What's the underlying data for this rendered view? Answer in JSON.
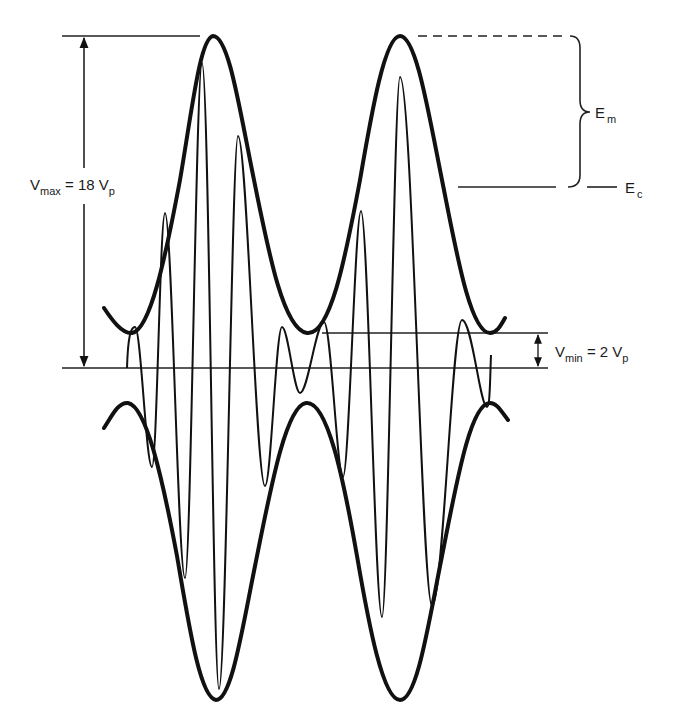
{
  "diagram": {
    "type": "amplitude-modulated-waveform",
    "colors": {
      "stroke": "#111111",
      "background": "#ffffff"
    },
    "labels": {
      "vmax": {
        "symbol": "V",
        "subscript": "max",
        "equals": " = 18 V",
        "unit_subscript": "p"
      },
      "vmin": {
        "symbol": "V",
        "subscript": "min",
        "equals": " = 2 V",
        "unit_subscript": "p"
      },
      "em": {
        "symbol": "E",
        "subscript": "m"
      },
      "ec": {
        "symbol": "E",
        "subscript": "c"
      }
    },
    "quantities": {
      "vmax_vp": 18,
      "vmin_vp": 2
    },
    "elements": [
      "upper-envelope",
      "lower-envelope",
      "carrier-wave",
      "zero-reference-line",
      "vmax-reference-line",
      "vmin-reference-line",
      "vmax-dimension-arrow",
      "vmin-dimension-arrow",
      "em-peak-dashed-line",
      "ec-level-line",
      "em-brace"
    ]
  }
}
